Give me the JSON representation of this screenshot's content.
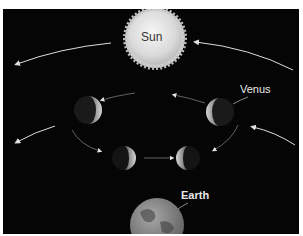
{
  "diagram": {
    "labels": {
      "sun": "Sun",
      "venus": "Venus",
      "earth": "Earth"
    },
    "bodies": [
      {
        "name": "Sun",
        "type": "star"
      },
      {
        "name": "Venus",
        "phases": [
          "left-upper-crescent",
          "right-upper-crescent",
          "left-lower-crescent",
          "right-lower-crescent"
        ]
      },
      {
        "name": "Earth",
        "type": "planet"
      }
    ],
    "colors": {
      "background": "#050505",
      "sun": "#e6e6e6",
      "venus_lit": "#c9c9c9",
      "earth": "#8a8a8a",
      "arrows": "#dddddd"
    }
  }
}
